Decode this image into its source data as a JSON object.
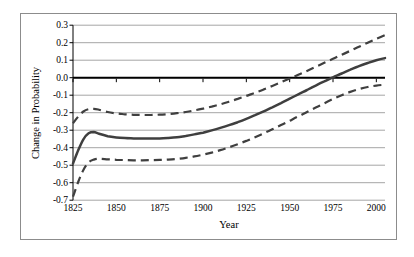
{
  "figure": {
    "background": "#ffffff",
    "border_color": "#8c8c8c"
  },
  "chart_data": {
    "type": "line",
    "title": "",
    "xlabel": "Year",
    "ylabel": "Change in Probability",
    "xlim": [
      1825,
      2005
    ],
    "ylim": [
      -0.7,
      0.3
    ],
    "grid": true,
    "legend": "none",
    "gridline_color": "#a6a6a6",
    "axis_color": "#000000",
    "zero_line": true,
    "x_tick_labels": [
      "1825",
      "1850",
      "1875",
      "1900",
      "1925",
      "1950",
      "1975",
      "2000"
    ],
    "y_tick_labels": [
      "0.3",
      "0.2",
      "0.1",
      "0.0",
      "-0.1",
      "-0.2",
      "-0.3",
      "-0.4",
      "-0.5",
      "-0.6",
      "-0.7"
    ],
    "x": [
      1825,
      1828,
      1831,
      1834,
      1837,
      1840,
      1845,
      1850,
      1855,
      1860,
      1865,
      1870,
      1875,
      1880,
      1885,
      1890,
      1895,
      1900,
      1905,
      1910,
      1915,
      1920,
      1925,
      1930,
      1935,
      1940,
      1945,
      1950,
      1955,
      1960,
      1965,
      1970,
      1975,
      1980,
      1985,
      1990,
      1995,
      2000,
      2005
    ],
    "series": [
      {
        "name": "estimate",
        "style": "solid",
        "color": "#3f3f3f",
        "width": 2.5,
        "values": [
          -0.49,
          -0.415,
          -0.352,
          -0.318,
          -0.311,
          -0.32,
          -0.334,
          -0.341,
          -0.345,
          -0.347,
          -0.348,
          -0.348,
          -0.347,
          -0.344,
          -0.34,
          -0.333,
          -0.324,
          -0.314,
          -0.301,
          -0.287,
          -0.271,
          -0.254,
          -0.235,
          -0.214,
          -0.192,
          -0.169,
          -0.145,
          -0.12,
          -0.095,
          -0.07,
          -0.045,
          -0.021,
          0.002,
          0.024,
          0.046,
          0.066,
          0.084,
          0.1,
          0.112
        ]
      },
      {
        "name": "upper-bound",
        "style": "dashed",
        "color": "#3f3f3f",
        "width": 2.2,
        "values": [
          -0.26,
          -0.222,
          -0.193,
          -0.18,
          -0.178,
          -0.183,
          -0.196,
          -0.204,
          -0.209,
          -0.212,
          -0.213,
          -0.213,
          -0.211,
          -0.208,
          -0.203,
          -0.196,
          -0.187,
          -0.177,
          -0.165,
          -0.152,
          -0.137,
          -0.121,
          -0.104,
          -0.086,
          -0.067,
          -0.047,
          -0.026,
          -0.005,
          0.017,
          0.039,
          0.062,
          0.085,
          0.108,
          0.131,
          0.154,
          0.177,
          0.2,
          0.222,
          0.243
        ]
      },
      {
        "name": "lower-bound",
        "style": "dashed",
        "color": "#3f3f3f",
        "width": 2.2,
        "values": [
          -0.68,
          -0.596,
          -0.527,
          -0.484,
          -0.468,
          -0.463,
          -0.466,
          -0.469,
          -0.471,
          -0.472,
          -0.472,
          -0.471,
          -0.47,
          -0.468,
          -0.464,
          -0.458,
          -0.45,
          -0.44,
          -0.428,
          -0.414,
          -0.398,
          -0.38,
          -0.361,
          -0.34,
          -0.318,
          -0.295,
          -0.271,
          -0.246,
          -0.221,
          -0.196,
          -0.171,
          -0.146,
          -0.122,
          -0.1,
          -0.081,
          -0.065,
          -0.053,
          -0.045,
          -0.04
        ]
      }
    ]
  }
}
